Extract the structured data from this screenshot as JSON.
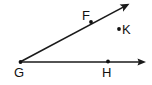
{
  "diagram": {
    "background_color": "#ffffff",
    "stroke_color": "#1a1a1a",
    "width": 152,
    "height": 85,
    "vertex": {
      "name": "G",
      "label": "G",
      "x": 20,
      "y": 62,
      "label_x": 20,
      "label_y": 76
    },
    "rays": [
      {
        "name": "ray-GH-horizontal",
        "from_label": "G",
        "through_label": "H",
        "x1": 20,
        "y1": 62,
        "x2": 146,
        "y2": 62,
        "has_arrowhead": true
      },
      {
        "name": "ray-GF-slanted",
        "from_label": "G",
        "through_label": "F",
        "x1": 20,
        "y1": 62,
        "x2": 129,
        "y2": 4,
        "has_arrowhead": true
      }
    ],
    "points": [
      {
        "name": "point-F",
        "label": "F",
        "x": 91,
        "y": 22,
        "label_x": 87,
        "label_y": 16,
        "on_ray": "ray-GF-slanted"
      },
      {
        "name": "point-H",
        "label": "H",
        "x": 108,
        "y": 61,
        "label_x": 108,
        "label_y": 76,
        "on_ray": "ray-GH-horizontal"
      },
      {
        "name": "point-K",
        "label": "K",
        "x": 119,
        "y": 29,
        "label_x": 124,
        "label_y": 30,
        "on_ray": null
      }
    ]
  }
}
